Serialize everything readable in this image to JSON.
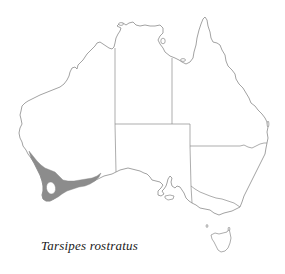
{
  "figure": {
    "type": "species-distribution-map",
    "region": "Australia",
    "species_label": "Tarsipes rostratus",
    "colors": {
      "background": "#ffffff",
      "outline": "#8a8a8a",
      "distribution_fill": "#8c8c8c",
      "label_text": "#1a1a1a"
    }
  },
  "map": {
    "states": [
      "Western Australia",
      "Northern Territory",
      "Queensland",
      "South Australia",
      "New South Wales",
      "Victoria",
      "Tasmania"
    ],
    "distribution_area": {
      "description": "South-western Western Australia coastal band",
      "shading": "solid grey"
    }
  }
}
